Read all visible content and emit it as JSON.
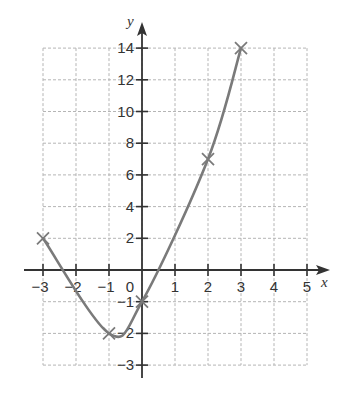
{
  "chart_data": {
    "type": "line",
    "title": "",
    "xlabel": "x",
    "ylabel": "y",
    "xlim": [
      -3,
      5
    ],
    "ylim": [
      -3,
      14
    ],
    "grid": true,
    "grid_style": "dashed",
    "x_ticks": [
      -3,
      -2,
      -1,
      0,
      1,
      2,
      3,
      4,
      5
    ],
    "x_tick_labels": [
      "−3",
      "−2",
      "−1",
      "0",
      "1",
      "2",
      "3",
      "4",
      "5"
    ],
    "y_ticks_positive": [
      2,
      4,
      6,
      8,
      10,
      12,
      14
    ],
    "y_tick_labels_positive": [
      "2",
      "4",
      "6",
      "8",
      "10",
      "12",
      "14"
    ],
    "y_ticks_negative": [
      -1,
      -2,
      -3
    ],
    "y_tick_labels_negative": [
      "−1",
      "−2",
      "−3"
    ],
    "scale_note": "Positive y gridlines are spaced every 2 units; negative y gridlines every 1 unit (uneven scale).",
    "series": [
      {
        "name": "curve",
        "style": "smooth curve",
        "color": "#7a7a7a",
        "marked_points": [
          {
            "x": -3,
            "y": 2
          },
          {
            "x": -1,
            "y": -2
          },
          {
            "x": 0,
            "y": -1
          },
          {
            "x": 2,
            "y": 7
          },
          {
            "x": 3,
            "y": 14
          }
        ],
        "marker": "x"
      }
    ]
  },
  "colors": {
    "axis": "#333333",
    "grid": "#b5b5b5",
    "curve": "#7a7a7a",
    "background": "#ffffff"
  }
}
